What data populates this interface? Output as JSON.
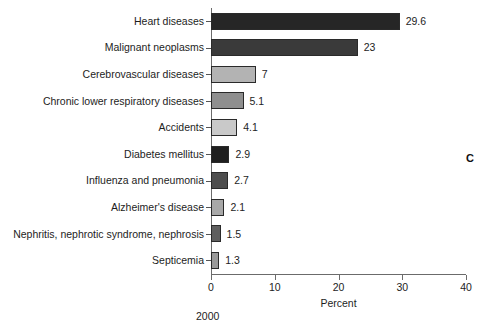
{
  "chart_data": {
    "type": "bar",
    "orientation": "horizontal",
    "title": "",
    "xlabel": "Percent",
    "ylabel": "",
    "xlim": [
      0,
      40
    ],
    "xticks": [
      0,
      10,
      20,
      30,
      40
    ],
    "xtick_labels": [
      "0",
      "10",
      "20",
      "30",
      "40"
    ],
    "grid": false,
    "legend": false,
    "categories": [
      "Heart diseases",
      "Malignant neoplasms",
      "Cerebrovascular diseases",
      "Chronic lower respiratory diseases",
      "Accidents",
      "Diabetes mellitus",
      "Influenza and pneumonia",
      "Alzheimer's disease",
      "Nephritis, nephrotic syndrome, nephrosis",
      "Septicemia"
    ],
    "values": [
      29.6,
      23,
      7,
      5.1,
      4.1,
      2.9,
      2.7,
      2.1,
      1.5,
      1.3
    ],
    "value_labels": [
      "29.6",
      "23",
      "7",
      "5.1",
      "4.1",
      "2.9",
      "2.7",
      "2.1",
      "1.5",
      "1.3"
    ],
    "bar_colors": [
      "#262626",
      "#3a3a3a",
      "#b3b3b3",
      "#8f8f8f",
      "#c9c9c9",
      "#1f1f1f",
      "#4d4d4d",
      "#a8a8a8",
      "#5e5e5e",
      "#9a9a9a"
    ],
    "annotations": [
      {
        "name": "panel-letter",
        "text": "C"
      },
      {
        "name": "year-note",
        "text": "2000"
      }
    ]
  },
  "panel_letter": "C",
  "year_note": "2000"
}
